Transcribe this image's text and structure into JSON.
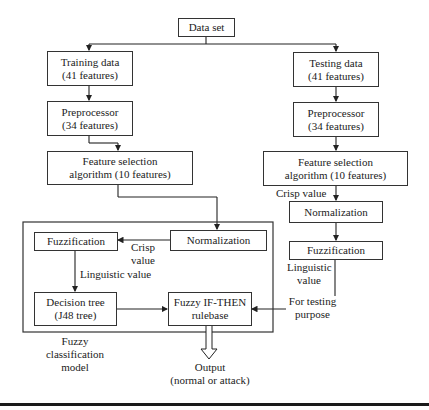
{
  "boxes": {
    "dataset": "Data set",
    "training_1": "Training data",
    "training_2": "(41 features)",
    "testing_1": "Testing data",
    "testing_2": "(41 features)",
    "pre_left_1": "Preprocessor",
    "pre_left_2": "(34 features)",
    "pre_right_1": "Preprocessor",
    "pre_right_2": "(34 features)",
    "fs_left_1": "Feature selection",
    "fs_left_2": "algorithm (10 features)",
    "fs_right_1": "Feature selection",
    "fs_right_2": "algorithm (10 features)",
    "norm_right": "Normalization",
    "fuzz_right": "Fuzzification",
    "fuzz_inner": "Fuzzification",
    "norm_inner": "Normalization",
    "dt_1": "Decision tree",
    "dt_2": "(J48 tree)",
    "rule_1": "Fuzzy IF-THEN",
    "rule_2": "rulebase"
  },
  "labels": {
    "crisp_right": "Crisp value",
    "crisp_inner_1": "Crisp",
    "crisp_inner_2": "value",
    "linguistic_inner": "Linguistic value",
    "linguistic_right_1": "Linguistic",
    "linguistic_right_2": "value",
    "testing_purpose_1": "For testing",
    "testing_purpose_2": "purpose",
    "model_1": "Fuzzy",
    "model_2": "classification",
    "model_3": "model",
    "output_1": "Output",
    "output_2": "(normal or attack)"
  }
}
